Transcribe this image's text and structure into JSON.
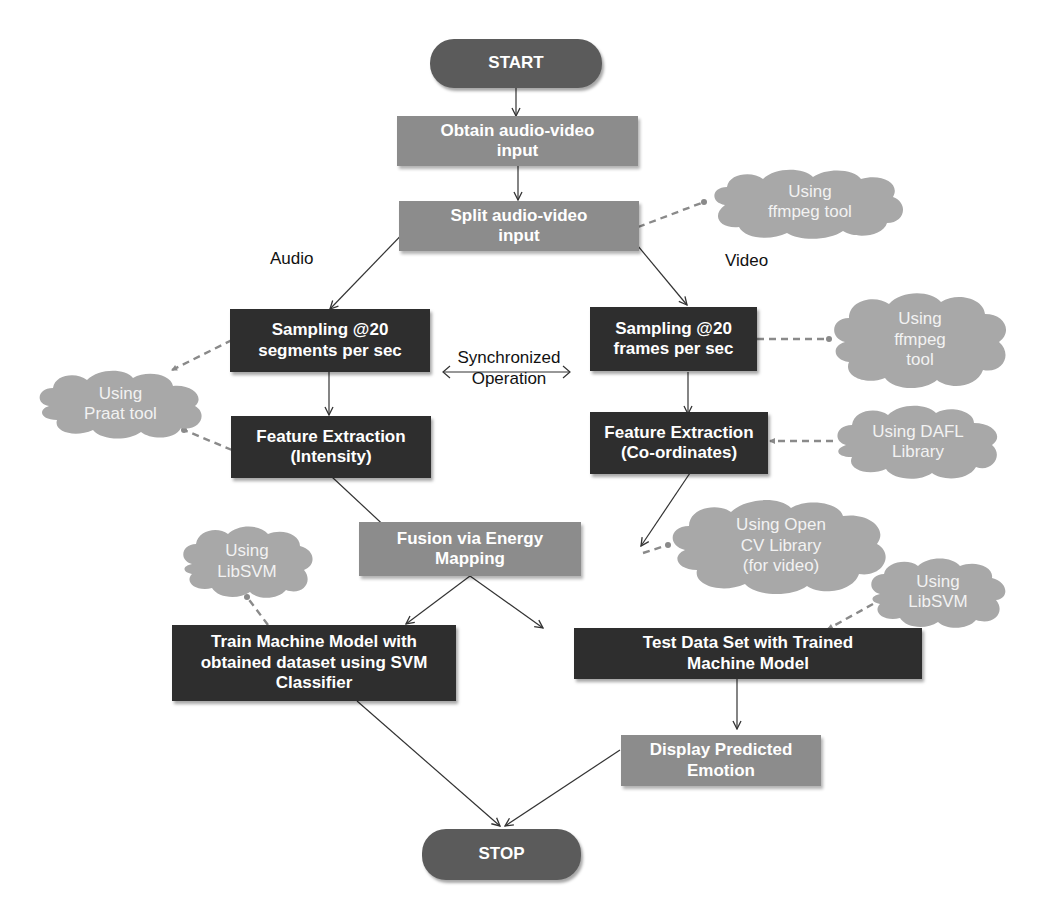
{
  "diagram": {
    "type": "flowchart",
    "colors": {
      "terminal": "#5b5b5b",
      "process_light": "#8c8c8c",
      "process_dark": "#2e2e2e",
      "cloud": "#a9a9a9",
      "arrow": "#333333",
      "dashed_link": "#8a8a8a"
    },
    "nodes": {
      "start": "START",
      "obtain": "Obtain audio-video\ninput",
      "split": "Split audio-video\ninput",
      "audio_sampling": "Sampling @20\nsegments per sec",
      "video_sampling": "Sampling @20\nframes per sec",
      "audio_feature": "Feature Extraction\n(Intensity)",
      "video_feature": "Feature Extraction\n(Co-ordinates)",
      "fusion": "Fusion via Energy\nMapping",
      "train": "Train Machine Model with\nobtained dataset using SVM\nClassifier",
      "test": "Test Data Set with Trained\nMachine Model",
      "display": "Display Predicted\nEmotion",
      "stop": "STOP"
    },
    "clouds": {
      "ffmpeg_split": "Using\nffmpeg tool",
      "ffmpeg_video": "Using\nffmpeg\ntool",
      "praat": "Using\nPraat tool",
      "dafl": "Using DAFL\nLibrary",
      "opencv": "Using Open\nCV Library\n(for video)",
      "libsvm_train": "Using\nLibSVM",
      "libsvm_test": "Using\nLibSVM"
    },
    "labels": {
      "audio": "Audio",
      "video": "Video",
      "sync": "Synchronized\nOperation"
    }
  }
}
